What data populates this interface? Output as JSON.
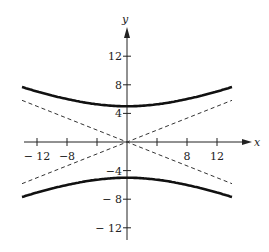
{
  "chart_data": {
    "type": "line",
    "title": "",
    "xlabel": "x",
    "ylabel": "y",
    "xlim": [
      -14,
      14
    ],
    "ylim": [
      -14,
      15
    ],
    "x_ticks": [
      -12,
      -8,
      -4,
      4,
      8,
      12
    ],
    "x_tick_labels": [
      "− 12",
      "−8",
      "",
      "",
      "8",
      "12"
    ],
    "y_ticks": [
      12,
      8,
      4,
      -4,
      -8,
      -12
    ],
    "y_tick_labels": [
      "12",
      "8",
      "4",
      "−4",
      "− 8",
      "− 12"
    ],
    "grid": false,
    "series": [
      {
        "name": "hyperbola upper branch",
        "style": "solid-thick",
        "equation": "y = 5*sqrt(1 + x^2/144)",
        "x": [
          -14,
          -12,
          -8,
          -4,
          0,
          4,
          8,
          12,
          14
        ],
        "y": [
          7.7,
          7.07,
          6.01,
          5.27,
          5,
          5.27,
          6.01,
          7.07,
          7.7
        ]
      },
      {
        "name": "hyperbola lower branch",
        "style": "solid-thick",
        "equation": "y = -5*sqrt(1 + x^2/144)",
        "x": [
          -14,
          -12,
          -8,
          -4,
          0,
          4,
          8,
          12,
          14
        ],
        "y": [
          -7.7,
          -7.07,
          -6.01,
          -5.27,
          -5,
          -5.27,
          -6.01,
          -7.07,
          -7.7
        ]
      },
      {
        "name": "asymptote y = 5x/12",
        "style": "dashed",
        "x": [
          -14,
          14
        ],
        "y": [
          -5.83,
          5.83
        ]
      },
      {
        "name": "asymptote y = -5x/12",
        "style": "dashed",
        "x": [
          -14,
          14
        ],
        "y": [
          5.83,
          -5.83
        ]
      }
    ]
  },
  "axes": {
    "x_label": "x",
    "y_label": "y"
  }
}
